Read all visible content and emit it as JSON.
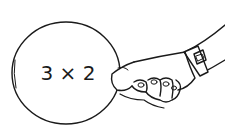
{
  "illustration": {
    "description": "Hand holding a round card",
    "card": {
      "expression": "3 × 2"
    },
    "colors": {
      "ink": "#1a1a1a",
      "background": "#ffffff"
    }
  }
}
